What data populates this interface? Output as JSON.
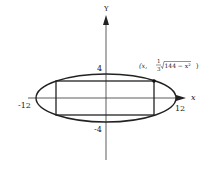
{
  "figure": {
    "type": "rectangle inscribed in ellipse",
    "ellipse_equation_hint": "x^2/144 + y^2/16 = 1",
    "axes": {
      "x_label": "x",
      "y_label": "Y"
    },
    "ticks": {
      "x_neg": "-12",
      "x_pos": "12",
      "y_pos": "4",
      "y_neg": "-4"
    },
    "point_label": {
      "prefix": "(x, ",
      "frac_num": "1",
      "frac_den": "3",
      "radicand": "144 − x²",
      "suffix": ")"
    },
    "colors": {
      "stroke": "#222222",
      "background": "#ffffff"
    }
  }
}
